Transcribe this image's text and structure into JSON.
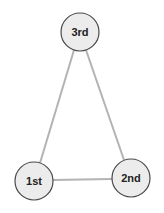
{
  "diagram": {
    "type": "triangle-graph",
    "nodes": [
      {
        "id": "first",
        "label": "1st",
        "cx": 34,
        "cy": 181,
        "r": 19
      },
      {
        "id": "second",
        "label": "2nd",
        "cx": 131,
        "cy": 178,
        "r": 19
      },
      {
        "id": "third",
        "label": "3rd",
        "cx": 80,
        "cy": 32,
        "r": 19
      }
    ],
    "edges": [
      {
        "from": "first",
        "to": "third"
      },
      {
        "from": "third",
        "to": "second"
      },
      {
        "from": "first",
        "to": "second"
      }
    ],
    "colors": {
      "edge": "#b3b3b3",
      "node_fill": "#ececec",
      "node_stroke": "#4a4a4a",
      "label": "#222222"
    }
  }
}
